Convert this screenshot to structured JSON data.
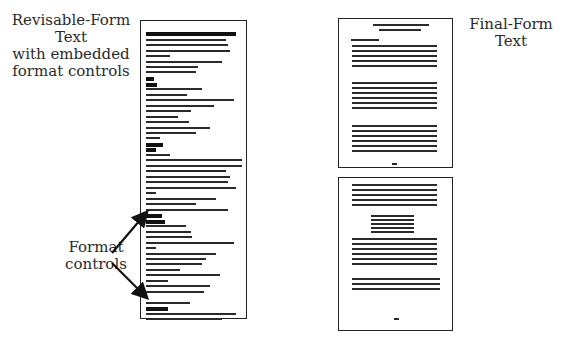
{
  "left_label": {
    "lines": [
      "Revisable-Form",
      "Text",
      "with embedded",
      "format controls"
    ]
  },
  "right_label": {
    "lines": [
      "Final-Form",
      "Text"
    ]
  },
  "callout": {
    "lines": [
      "Format",
      "controls"
    ]
  },
  "colors": {
    "ink": "#222222",
    "background": "#ffffff"
  }
}
